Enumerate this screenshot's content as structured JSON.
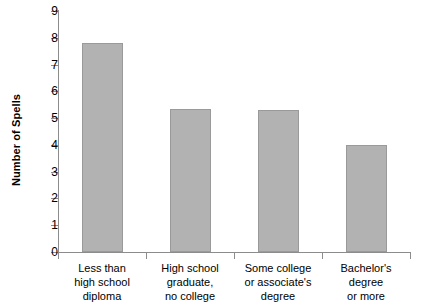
{
  "chart_data": {
    "type": "bar",
    "title": "",
    "subtitle": "",
    "xlabel": "",
    "ylabel": "Number of Spells",
    "categories": [
      "Less than high school diploma",
      "High school graduate, no college",
      "Some college or associate's degree",
      "Bachelor's degree or more"
    ],
    "category_lines": [
      [
        "Less than",
        "high school",
        "diploma"
      ],
      [
        "High school",
        "graduate,",
        "no college"
      ],
      [
        "Some college",
        "or associate's",
        "degree"
      ],
      [
        "Bachelor's",
        "degree",
        "or more"
      ]
    ],
    "values": [
      7.8,
      5.35,
      5.3,
      4.0
    ],
    "ylim": [
      0,
      9
    ],
    "ytick_labels": [
      "9",
      "8",
      "7",
      "6",
      "5",
      "4",
      "3",
      "2",
      "1",
      "0"
    ],
    "ytick_values": [
      9,
      8,
      7,
      6,
      5,
      4,
      3,
      2,
      1,
      0
    ],
    "ytick_step": 1,
    "grid": false,
    "legend": false,
    "legend_position": "none",
    "bar_color": "#b2b2b2",
    "bar_border_color": "#9a9a9a",
    "axis_color": "#8c8c8c",
    "background_color": "#ffffff",
    "text_color": "#000000"
  }
}
